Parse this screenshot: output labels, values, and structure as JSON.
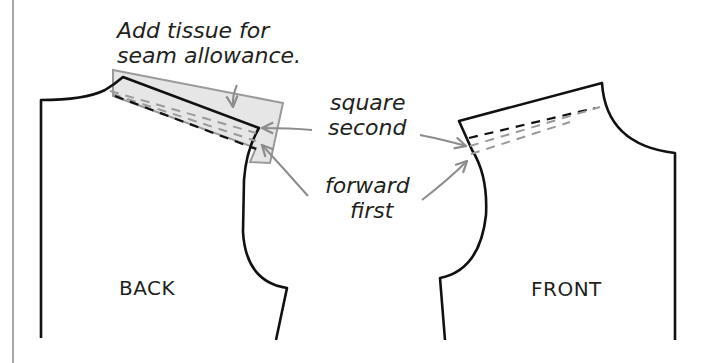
{
  "diagram": {
    "type": "sewing-pattern-adjustment",
    "colors": {
      "outline": "#111111",
      "annotation_gray": "#8c8c8c",
      "tissue_fill": "#e6e6e6",
      "tissue_stroke": "#9a9a9a",
      "text": "#231f20",
      "margin_rule": "#a8a8a8"
    },
    "annotations": {
      "tissue_line1": "Add tissue for",
      "tissue_line2": "seam allowance.",
      "square_line1": "square",
      "square_line2": "second",
      "forward_line1": "forward",
      "forward_line2": "first"
    },
    "pieces": {
      "back_label": "BACK",
      "front_label": "FRONT"
    }
  }
}
